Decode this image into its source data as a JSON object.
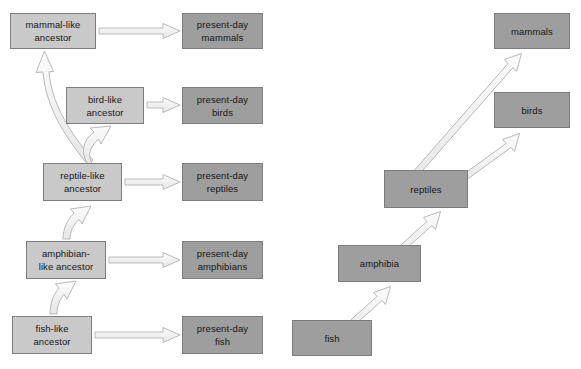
{
  "diagram": {
    "colors": {
      "box_ancestor_fill": "#c9c9c9",
      "box_present_fill": "#9e9e9e",
      "box_border": "#7d7d7d",
      "arrow_fill": "#f2f2f2",
      "arrow_stroke": "#b4b4b4",
      "background": "#ffffff",
      "text": "#161616"
    },
    "left_tree": {
      "name": "ancestor-and-present-day-tree",
      "nodes": [
        {
          "id": "mammal-like-ancestor",
          "lines": [
            "mammal-like",
            "ancestor"
          ],
          "style": "light",
          "x": 10,
          "y": 13,
          "w": 86,
          "h": 36
        },
        {
          "id": "present-day-mammals",
          "lines": [
            "present-day",
            "mammals"
          ],
          "style": "dark",
          "x": 182,
          "y": 13,
          "w": 81,
          "h": 36
        },
        {
          "id": "bird-like-ancestor",
          "lines": [
            "bird-like",
            "ancestor"
          ],
          "style": "light",
          "x": 66,
          "y": 87,
          "w": 78,
          "h": 37
        },
        {
          "id": "present-day-birds",
          "lines": [
            "present-day",
            "birds"
          ],
          "style": "dark",
          "x": 182,
          "y": 87,
          "w": 81,
          "h": 37
        },
        {
          "id": "reptile-like-ancestor",
          "lines": [
            "reptile-like",
            "ancestor"
          ],
          "style": "light",
          "x": 43,
          "y": 163,
          "w": 79,
          "h": 38
        },
        {
          "id": "present-day-reptiles",
          "lines": [
            "present-day",
            "reptiles"
          ],
          "style": "dark",
          "x": 182,
          "y": 163,
          "w": 81,
          "h": 38
        },
        {
          "id": "amphibian-like-ancestor",
          "lines": [
            "amphibian-",
            "like ancestor"
          ],
          "style": "light",
          "x": 26,
          "y": 241,
          "w": 80,
          "h": 38
        },
        {
          "id": "present-day-amphibians",
          "lines": [
            "present-day",
            "amphibians"
          ],
          "style": "dark",
          "x": 182,
          "y": 241,
          "w": 81,
          "h": 38
        },
        {
          "id": "fish-like-ancestor",
          "lines": [
            "fish-like",
            "ancestor"
          ],
          "style": "light",
          "x": 12,
          "y": 316,
          "w": 80,
          "h": 38
        },
        {
          "id": "present-day-fish",
          "lines": [
            "present-day",
            "fish"
          ],
          "style": "dark",
          "x": 182,
          "y": 316,
          "w": 81,
          "h": 38
        }
      ],
      "edges": [
        {
          "from": "mammal-like-ancestor",
          "to": "present-day-mammals",
          "kind": "straight"
        },
        {
          "from": "bird-like-ancestor",
          "to": "present-day-birds",
          "kind": "straight"
        },
        {
          "from": "reptile-like-ancestor",
          "to": "present-day-reptiles",
          "kind": "straight"
        },
        {
          "from": "amphibian-like-ancestor",
          "to": "present-day-amphibians",
          "kind": "straight"
        },
        {
          "from": "fish-like-ancestor",
          "to": "present-day-fish",
          "kind": "straight"
        },
        {
          "from": "reptile-like-ancestor",
          "to": "mammal-like-ancestor",
          "kind": "curved"
        },
        {
          "from": "reptile-like-ancestor",
          "to": "bird-like-ancestor",
          "kind": "curved"
        },
        {
          "from": "amphibian-like-ancestor",
          "to": "reptile-like-ancestor",
          "kind": "curved"
        },
        {
          "from": "fish-like-ancestor",
          "to": "amphibian-like-ancestor",
          "kind": "curved"
        }
      ]
    },
    "right_tree": {
      "name": "modern-taxa-tree",
      "nodes": [
        {
          "id": "mammals",
          "lines": [
            "mammals"
          ],
          "style": "dark",
          "x": 494,
          "y": 13,
          "w": 76,
          "h": 36
        },
        {
          "id": "birds",
          "lines": [
            "birds"
          ],
          "style": "dark",
          "x": 494,
          "y": 92,
          "w": 76,
          "h": 36
        },
        {
          "id": "reptiles",
          "lines": [
            "reptiles"
          ],
          "style": "dark",
          "x": 384,
          "y": 170,
          "w": 84,
          "h": 38
        },
        {
          "id": "amphibia",
          "lines": [
            "amphibia"
          ],
          "style": "dark",
          "x": 338,
          "y": 245,
          "w": 83,
          "h": 37
        },
        {
          "id": "fish",
          "lines": [
            "fish"
          ],
          "style": "dark",
          "x": 292,
          "y": 320,
          "w": 80,
          "h": 36
        }
      ],
      "edges": [
        {
          "from": "reptiles",
          "to": "mammals",
          "kind": "diagonal"
        },
        {
          "from": "reptiles",
          "to": "birds",
          "kind": "diagonal"
        },
        {
          "from": "amphibia",
          "to": "reptiles",
          "kind": "diagonal"
        },
        {
          "from": "fish",
          "to": "amphibia",
          "kind": "diagonal"
        }
      ]
    }
  }
}
